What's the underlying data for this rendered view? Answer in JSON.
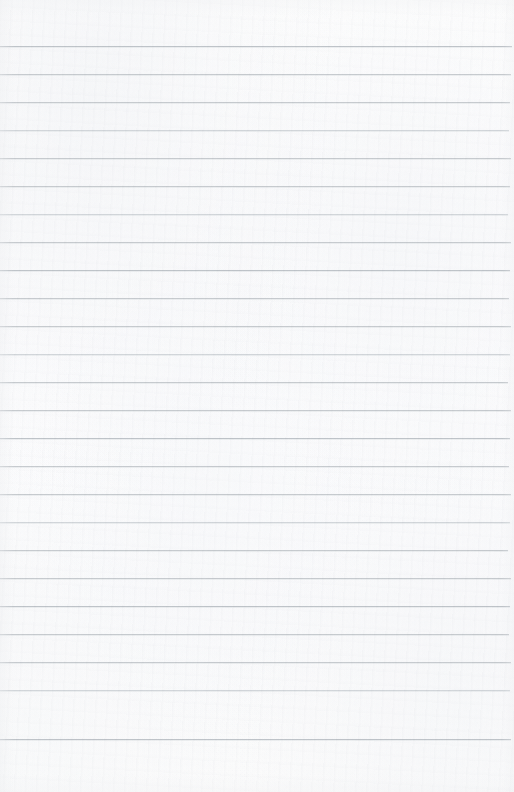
{
  "document": {
    "type": "lined-paper",
    "title": "Blank lined paper",
    "content_text": "",
    "has_handwriting": false,
    "has_printed_text": false,
    "orientation": "portrait"
  },
  "paper": {
    "width_px": 514,
    "height_px": 792,
    "background_color": "#fcfcfc",
    "texture": "subtle-mottled-scan-grain",
    "margin_rule": "none",
    "holes": "none"
  },
  "ruling": {
    "line_color": "#c7cbcf",
    "line_color_faint": "#d2d6da",
    "line_color_dark": "#bfc4c9",
    "line_thickness_px": 1,
    "spacing_px": 28,
    "first_line_y": 46,
    "last_line_y": 739,
    "line_count": 25,
    "left_inset_px": 0,
    "right_inset_px": 4,
    "lines": [
      {
        "y": 46,
        "tone": "dark",
        "right_inset": 2
      },
      {
        "y": 74,
        "tone": "normal",
        "right_inset": 3
      },
      {
        "y": 102,
        "tone": "normal",
        "right_inset": 4
      },
      {
        "y": 130,
        "tone": "faint",
        "right_inset": 5
      },
      {
        "y": 158,
        "tone": "normal",
        "right_inset": 3
      },
      {
        "y": 186,
        "tone": "normal",
        "right_inset": 4
      },
      {
        "y": 214,
        "tone": "faint",
        "right_inset": 6
      },
      {
        "y": 242,
        "tone": "normal",
        "right_inset": 3
      },
      {
        "y": 270,
        "tone": "dark",
        "right_inset": 4
      },
      {
        "y": 298,
        "tone": "normal",
        "right_inset": 5
      },
      {
        "y": 326,
        "tone": "normal",
        "right_inset": 3
      },
      {
        "y": 354,
        "tone": "faint",
        "right_inset": 4
      },
      {
        "y": 382,
        "tone": "normal",
        "right_inset": 6
      },
      {
        "y": 410,
        "tone": "normal",
        "right_inset": 3
      },
      {
        "y": 438,
        "tone": "dark",
        "right_inset": 4
      },
      {
        "y": 466,
        "tone": "normal",
        "right_inset": 5
      },
      {
        "y": 494,
        "tone": "normal",
        "right_inset": 3
      },
      {
        "y": 522,
        "tone": "faint",
        "right_inset": 4
      },
      {
        "y": 550,
        "tone": "normal",
        "right_inset": 6
      },
      {
        "y": 578,
        "tone": "normal",
        "right_inset": 3
      },
      {
        "y": 606,
        "tone": "dark",
        "right_inset": 4
      },
      {
        "y": 634,
        "tone": "normal",
        "right_inset": 5
      },
      {
        "y": 662,
        "tone": "normal",
        "right_inset": 3
      },
      {
        "y": 690,
        "tone": "faint",
        "right_inset": 4
      },
      {
        "y": 739,
        "tone": "dark",
        "right_inset": 3
      }
    ]
  }
}
